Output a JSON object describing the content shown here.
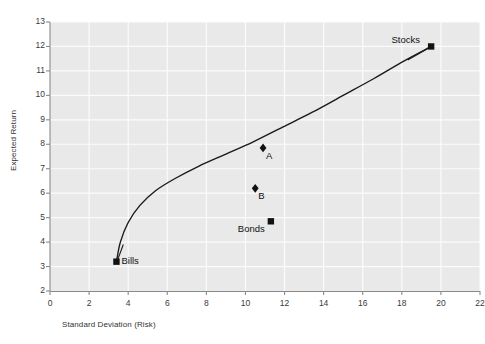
{
  "chart_data": {
    "type": "line",
    "title": "",
    "xlabel": "Standard Deviation (Risk)",
    "ylabel": "Expected Return",
    "xlim": [
      0,
      22
    ],
    "ylim": [
      2,
      13
    ],
    "xticks": [
      0,
      2,
      4,
      6,
      8,
      10,
      12,
      14,
      16,
      18,
      20,
      22
    ],
    "yticks": [
      2,
      3,
      4,
      5,
      6,
      7,
      8,
      9,
      10,
      11,
      12,
      13
    ],
    "grid": true,
    "legend": "none",
    "series": [
      {
        "name": "Efficient Frontier",
        "type": "line",
        "color": "#1a1a1a",
        "x": [
          3.4,
          3.6,
          4.0,
          4.6,
          5.4,
          6.4,
          7.6,
          9.0,
          10.4,
          11.9,
          13.4,
          15.0,
          16.6,
          18.1,
          19.5
        ],
        "y": [
          3.2,
          4.0,
          4.8,
          5.5,
          6.1,
          6.6,
          7.1,
          7.6,
          8.1,
          8.7,
          9.3,
          10.0,
          10.7,
          11.4,
          12.0
        ]
      }
    ],
    "points": [
      {
        "label": "Bills",
        "x": 3.4,
        "y": 3.2,
        "marker": "square",
        "label_pos": "right"
      },
      {
        "label": "Stocks",
        "x": 19.5,
        "y": 12.0,
        "marker": "square",
        "label_pos": "left"
      },
      {
        "label": "Bonds",
        "x": 11.3,
        "y": 4.85,
        "marker": "square",
        "label_pos": "below-left"
      },
      {
        "label": "A",
        "x": 10.9,
        "y": 7.85,
        "marker": "diamond",
        "label_pos": "below-right"
      },
      {
        "label": "B",
        "x": 10.5,
        "y": 6.2,
        "marker": "diamond",
        "label_pos": "below-right"
      }
    ],
    "annotations": [
      {
        "text": "leader-line",
        "from": [
          18.3,
          11.45
        ],
        "to": [
          19.4,
          11.95
        ]
      },
      {
        "text": "leader-line",
        "from": [
          3.75,
          3.9
        ],
        "to": [
          3.45,
          3.25
        ]
      }
    ],
    "colors": {
      "plot_background": "#e9e9e9",
      "gridline": "#fbfbfb",
      "axis": "#8a8a8a",
      "curve": "#1a1a1a",
      "marker": "#111111",
      "tick_text": "#3a3a3a"
    }
  },
  "topnote": ""
}
